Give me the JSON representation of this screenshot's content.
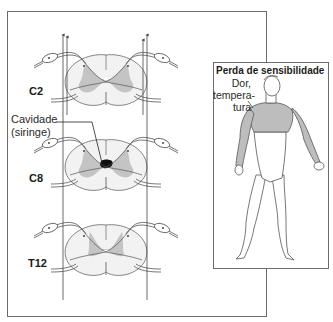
{
  "figure": {
    "segments": [
      {
        "id": "c2",
        "label": "C2"
      },
      {
        "id": "c8",
        "label": "C8"
      },
      {
        "id": "t12",
        "label": "T12"
      }
    ],
    "cavity_label": {
      "line1": "Cavidade",
      "line2": "(siringe)"
    },
    "inset": {
      "title": "Perda de sensibilidade",
      "region_label": {
        "line1": "Dor,",
        "line2": "tempera-",
        "line3": "tura"
      }
    },
    "colors": {
      "frame": "#6b6b6b",
      "white_matter": "#f2f2f2",
      "gray_matter": "#c4c4c4",
      "syrinx": "#111111",
      "sensory_loss": "#bdbdbd",
      "outline": "#555555"
    }
  }
}
